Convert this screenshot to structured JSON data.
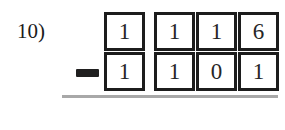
{
  "problem": {
    "number_label": "10)",
    "operator": "−",
    "operator_name": "minus-sign",
    "minuend_digits": [
      "1",
      "1",
      "1",
      "6"
    ],
    "subtrahend_digits": [
      "1",
      "1",
      "0",
      "1"
    ],
    "answer_digits": [
      "",
      "",
      "",
      ""
    ],
    "minuend_value": "1116",
    "subtrahend_value": "1101",
    "rule_color": "#a8a8a8",
    "box_border_color": "#1c1c1c",
    "ink_color": "#262626"
  }
}
